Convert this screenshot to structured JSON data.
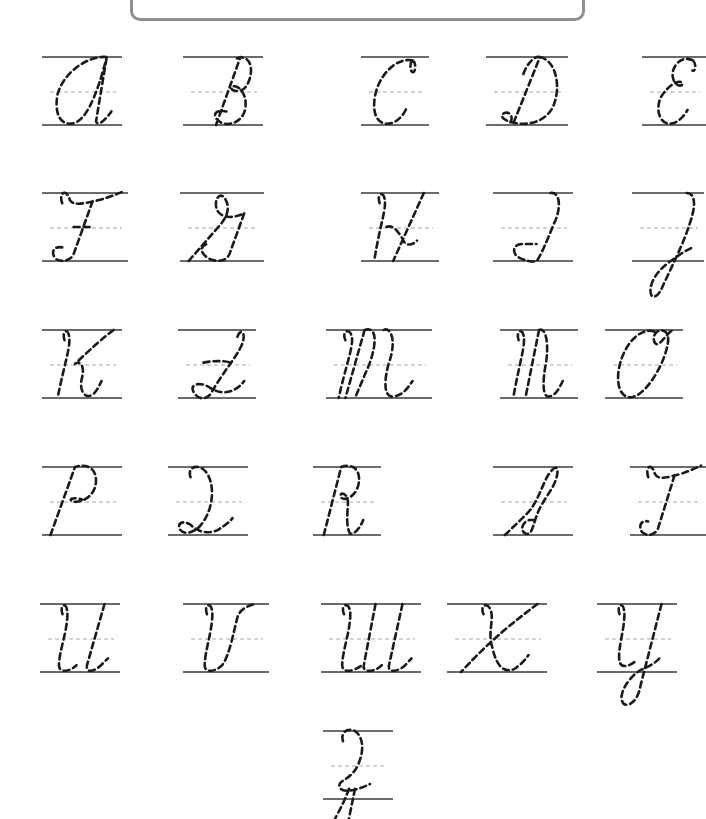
{
  "worksheet": {
    "title": "",
    "type": "cursive-uppercase-tracing",
    "colors": {
      "guide_line": "#6b6b6b",
      "mid_line": "#a8a8a8",
      "trace_stroke": "#1a1a1a",
      "title_border": "#8f8f8f"
    },
    "rows": [
      {
        "letters": [
          "A",
          "B",
          "C",
          "D",
          "E"
        ]
      },
      {
        "letters": [
          "F",
          "G",
          "H",
          "I",
          "J"
        ]
      },
      {
        "letters": [
          "K",
          "L",
          "M",
          "N",
          "O"
        ]
      },
      {
        "letters": [
          "P",
          "Q",
          "R",
          "S",
          "T"
        ]
      },
      {
        "letters": [
          "U",
          "V",
          "W",
          "X",
          "Y"
        ]
      },
      {
        "letters": [
          "Z"
        ]
      }
    ]
  }
}
